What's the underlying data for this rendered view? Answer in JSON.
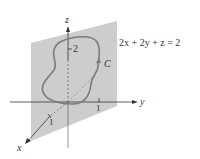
{
  "figure": {
    "plane_equation": "2x + 2y + z = 2",
    "curve_label": "C",
    "axes": {
      "x_label": "x",
      "y_label": "y",
      "z_label": "z"
    },
    "ticks": {
      "z_tick": "2",
      "y_tick": "1",
      "x_tick": "1"
    },
    "colors": {
      "plane_fill": "#c8c8c8",
      "curve": "#7a7a7a",
      "axes": "#333333"
    }
  }
}
